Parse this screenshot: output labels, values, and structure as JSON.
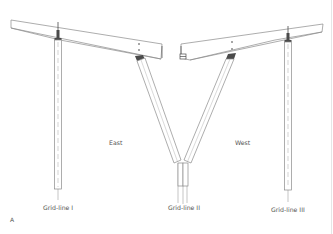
{
  "figure": {
    "panel_label": "A",
    "labels": {
      "east": "East",
      "west": "West"
    },
    "grid_lines": [
      {
        "label": "Grid-line I"
      },
      {
        "label": "Grid-line II"
      },
      {
        "label": "Grid-line III"
      }
    ],
    "colors": {
      "line": "#8a8a8a",
      "dark_line": "#4a4a4a",
      "dash": "#b5b5b5",
      "text": "#555555",
      "background": "#ffffff"
    }
  }
}
